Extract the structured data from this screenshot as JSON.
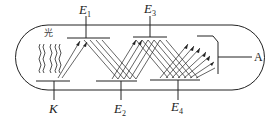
{
  "diagram": {
    "labels": {
      "light": "光",
      "cathode": "K",
      "anode": "A",
      "dynodes": [
        {
          "letter": "E",
          "sub": "1"
        },
        {
          "letter": "E",
          "sub": "2"
        },
        {
          "letter": "E",
          "sub": "3"
        },
        {
          "letter": "E",
          "sub": "4"
        }
      ]
    },
    "colors": {
      "line": "#222222",
      "background": "#ffffff"
    }
  }
}
